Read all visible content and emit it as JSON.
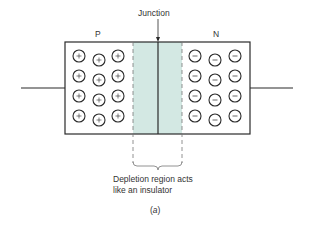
{
  "diagram": {
    "labels": {
      "junction": "Junction",
      "p_region": "P",
      "n_region": "N",
      "caption_line1": "Depletion region acts",
      "caption_line2": "like an insulator",
      "figure_open": "(",
      "figure_letter": "a",
      "figure_close": ")"
    },
    "colors": {
      "outline": "#2a2a2a",
      "depletion_fill": "#d3e8e3",
      "dashed": "#777777",
      "background": "#ffffff"
    },
    "regions": {
      "p_side": {
        "charge_symbol": "+",
        "carrier": "holes",
        "rows": 4,
        "cols": 3
      },
      "n_side": {
        "charge_symbol": "−",
        "carrier": "electrons",
        "rows": 4,
        "cols": 3
      },
      "depletion": {
        "description": "Depletion region acts like an insulator"
      }
    },
    "geometry": {
      "box": {
        "x": 65,
        "y": 42,
        "w": 185,
        "h": 92
      },
      "depletion_x": [
        133,
        182
      ],
      "junction_x": 158,
      "lead_y": 88,
      "left_lead_x": [
        21,
        65
      ],
      "right_lead_x": [
        250,
        293
      ]
    }
  }
}
